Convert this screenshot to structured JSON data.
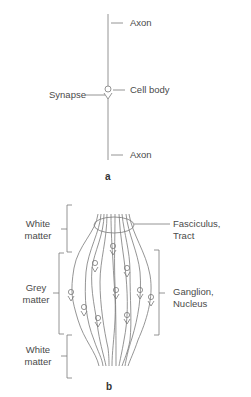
{
  "panel_a": {
    "letter": "a",
    "labels": {
      "axon_top": "Axon",
      "cell_body": "Cell body",
      "synapse": "Synapse",
      "axon_bottom": "Axon"
    }
  },
  "panel_b": {
    "letter": "b",
    "left_labels": {
      "white_matter_top_line1": "White",
      "white_matter_top_line2": "matter",
      "grey_matter_line1": "Grey",
      "grey_matter_line2": "matter",
      "white_matter_bottom_line1": "White",
      "white_matter_bottom_line2": "matter"
    },
    "right_labels": {
      "fasciculus_line1": "Fasciculus,",
      "fasciculus_line2": "Tract",
      "ganglion_line1": "Ganglion,",
      "ganglion_line2": "Nucleus"
    }
  },
  "colors": {
    "line": "#7a7a7a",
    "text": "#4a4a4a",
    "background": "#ffffff"
  }
}
